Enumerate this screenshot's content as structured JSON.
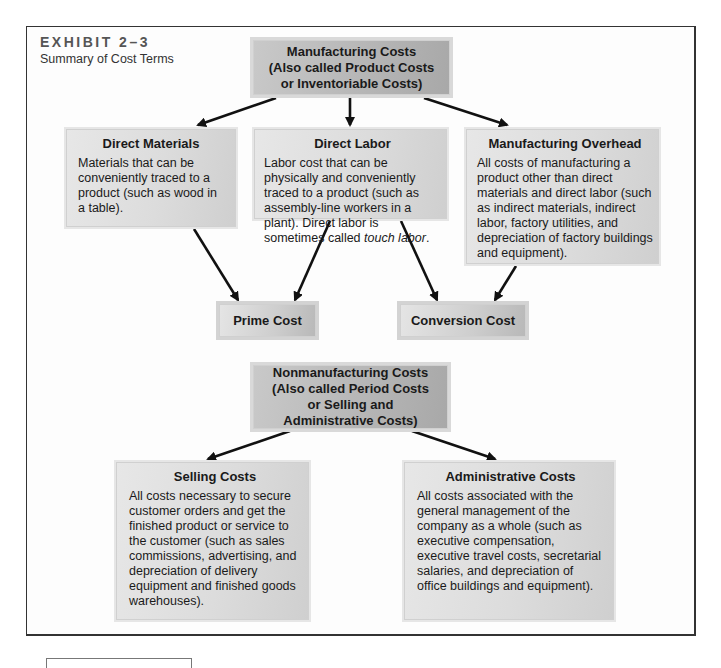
{
  "exhibit": {
    "label": "EXHIBIT 2–3",
    "subtitle": "Summary of Cost Terms"
  },
  "manufacturing_costs": {
    "title": "Manufacturing Costs\n(Also called Product Costs\nor Inventoriable Costs)"
  },
  "direct_materials": {
    "title": "Direct Materials",
    "description": "Materials that can be conveniently traced to a product (such as wood in a table)."
  },
  "direct_labor": {
    "title": "Direct Labor",
    "description_prefix": "Labor cost that can be physically and conveniently traced to a product (such as assembly-line workers in a plant). Direct labor is sometimes called ",
    "description_emphasis": "touch labor",
    "description_suffix": "."
  },
  "manufacturing_overhead": {
    "title": "Manufacturing Overhead",
    "description": "All costs of manufacturing a product other than direct materials and direct labor (such as indirect materials, indirect labor, factory utilities, and depreciation of factory buildings and equipment)."
  },
  "prime_cost": {
    "title": "Prime Cost"
  },
  "conversion_cost": {
    "title": "Conversion Cost"
  },
  "nonmanufacturing_costs": {
    "title": "Nonmanufacturing Costs\n(Also called Period Costs\nor Selling and\nAdministrative Costs)"
  },
  "selling_costs": {
    "title": "Selling Costs",
    "description": "All costs necessary to secure customer orders and get the finished product or service to the customer (such as sales commissions, advertising, and depreciation of delivery equipment and finished goods warehouses)."
  },
  "administrative_costs": {
    "title": "Administrative Costs",
    "description": "All costs associated with the general management of the company as a whole (such as executive compensation, executive travel costs, secretarial salaries, and depreciation of office buildings and equipment)."
  },
  "colors": {
    "frame_border": "#333333",
    "header_box_fill": "#b5b5b5",
    "content_box_fill": "#dcdcdc",
    "arrow": "#111111",
    "exhibit_label": "#555555"
  }
}
